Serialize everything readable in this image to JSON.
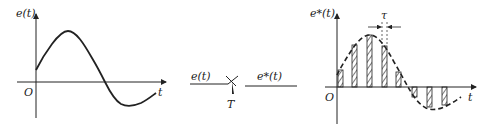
{
  "left_plot": {
    "y_label": "e(t)",
    "x_label": "t",
    "origin_label": "O",
    "curve": "continuous sine wave e(t)"
  },
  "sampler": {
    "input_label": "e(t)",
    "output_label": "e*(t)",
    "period_label": "T"
  },
  "right_plot": {
    "y_label": "e*(t)",
    "x_label": "t",
    "origin_label": "O",
    "pulse_width_label": "τ",
    "curve": "dashed envelope with hatched sampled pulses"
  },
  "colors": {
    "ink": "#222222",
    "background": "#ffffff"
  }
}
